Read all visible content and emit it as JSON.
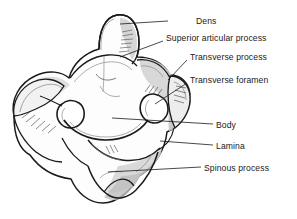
{
  "figure": {
    "background_color": "#ffffff",
    "line_color": "#1a1a1a",
    "shade_light": "#e3e3e3",
    "shade_mid": "#c9c9c9",
    "shade_dark": "#a8a8a8",
    "leader_color": "#1a1a1a"
  },
  "labels": [
    {
      "id": "dens",
      "text": "Dens",
      "x": 196,
      "y": 16,
      "leader": {
        "x1": 168,
        "y1": 21,
        "x2": 120,
        "y2": 24
      }
    },
    {
      "id": "superior-articular-process",
      "text": "Superior articular process",
      "x": 166,
      "y": 33,
      "leader": {
        "x1": 163,
        "y1": 41,
        "x2": 120,
        "y2": 57
      }
    },
    {
      "id": "transverse-process",
      "text": "Transverse process",
      "x": 190,
      "y": 52,
      "leader": {
        "x1": 187,
        "y1": 60,
        "x2": 168,
        "y2": 80
      }
    },
    {
      "id": "transverse-foramen",
      "text": "Transverse foramen",
      "x": 190,
      "y": 75,
      "leader": {
        "x1": 187,
        "y1": 83,
        "x2": 155,
        "y2": 104
      }
    },
    {
      "id": "body",
      "text": "Body",
      "x": 216,
      "y": 120,
      "leader": {
        "x1": 213,
        "y1": 124,
        "x2": 112,
        "y2": 118
      }
    },
    {
      "id": "lamina",
      "text": "Lamina",
      "x": 216,
      "y": 141,
      "leader": {
        "x1": 213,
        "y1": 145,
        "x2": 160,
        "y2": 141
      }
    },
    {
      "id": "spinous-process",
      "text": "Spinous process",
      "x": 204,
      "y": 163,
      "leader": {
        "x1": 201,
        "y1": 167,
        "x2": 108,
        "y2": 172
      }
    }
  ]
}
